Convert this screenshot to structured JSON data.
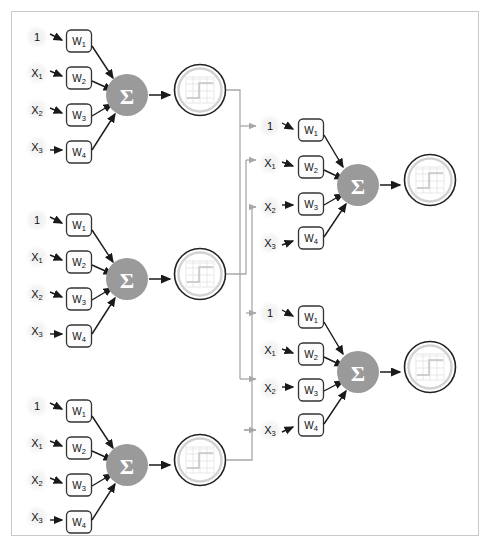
{
  "diagram": {
    "type": "neural-network-diagram",
    "colors": {
      "frame_border": "#c9c9c9",
      "background": "#ffffff",
      "sum_node_fill": "#9a9a9a",
      "sum_node_text": "#ffffff",
      "weight_box_fill": "#fcfcfc",
      "weight_box_stroke": "#333333",
      "arrow_dark": "#1a1a1a",
      "bus_line": "#a8a8a8",
      "activation_outer_ring": "#222222",
      "activation_inner_ring": "#d0d0d0",
      "input_halo": "#f2f2f2",
      "plot_line": "#dcdcdc"
    },
    "symbols": {
      "sum_glyph": "Σ",
      "bias_label": "1",
      "weight_prefix": "W",
      "input_prefix": "X"
    }
  },
  "layer1": {
    "name": "hidden-layer",
    "neuron_count": 3,
    "neurons": [
      {
        "id": "l1-n1",
        "inputs": [
          {
            "label": "1",
            "sub": ""
          },
          {
            "label": "X",
            "sub": "1"
          },
          {
            "label": "X",
            "sub": "2"
          },
          {
            "label": "X",
            "sub": "3"
          }
        ],
        "weights": [
          {
            "label": "W",
            "sub": "1"
          },
          {
            "label": "W",
            "sub": "2"
          },
          {
            "label": "W",
            "sub": "3"
          },
          {
            "label": "W",
            "sub": "4"
          }
        ],
        "sum_label": "Σ",
        "activation": "step-function"
      },
      {
        "id": "l1-n2",
        "inputs": [
          {
            "label": "1",
            "sub": ""
          },
          {
            "label": "X",
            "sub": "1"
          },
          {
            "label": "X",
            "sub": "2"
          },
          {
            "label": "X",
            "sub": "3"
          }
        ],
        "weights": [
          {
            "label": "W",
            "sub": "1"
          },
          {
            "label": "W",
            "sub": "2"
          },
          {
            "label": "W",
            "sub": "3"
          },
          {
            "label": "W",
            "sub": "4"
          }
        ],
        "sum_label": "Σ",
        "activation": "step-function"
      },
      {
        "id": "l1-n3",
        "inputs": [
          {
            "label": "1",
            "sub": ""
          },
          {
            "label": "X",
            "sub": "1"
          },
          {
            "label": "X",
            "sub": "2"
          },
          {
            "label": "X",
            "sub": "3"
          }
        ],
        "weights": [
          {
            "label": "W",
            "sub": "1"
          },
          {
            "label": "W",
            "sub": "2"
          },
          {
            "label": "W",
            "sub": "3"
          },
          {
            "label": "W",
            "sub": "4"
          }
        ],
        "sum_label": "Σ",
        "activation": "step-function"
      }
    ]
  },
  "layer2": {
    "name": "output-layer",
    "neuron_count": 2,
    "neurons": [
      {
        "id": "l2-n1",
        "inputs": [
          {
            "label": "1",
            "sub": ""
          },
          {
            "label": "X",
            "sub": "1"
          },
          {
            "label": "X",
            "sub": "2"
          },
          {
            "label": "X",
            "sub": "3"
          }
        ],
        "weights": [
          {
            "label": "W",
            "sub": "1"
          },
          {
            "label": "W",
            "sub": "2"
          },
          {
            "label": "W",
            "sub": "3"
          },
          {
            "label": "W",
            "sub": "4"
          }
        ],
        "sum_label": "Σ",
        "activation": "step-function"
      },
      {
        "id": "l2-n2",
        "inputs": [
          {
            "label": "1",
            "sub": ""
          },
          {
            "label": "X",
            "sub": "1"
          },
          {
            "label": "X",
            "sub": "2"
          },
          {
            "label": "X",
            "sub": "3"
          }
        ],
        "weights": [
          {
            "label": "W",
            "sub": "1"
          },
          {
            "label": "W",
            "sub": "2"
          },
          {
            "label": "W",
            "sub": "3"
          },
          {
            "label": "W",
            "sub": "4"
          }
        ],
        "sum_label": "Σ",
        "activation": "step-function"
      }
    ]
  }
}
